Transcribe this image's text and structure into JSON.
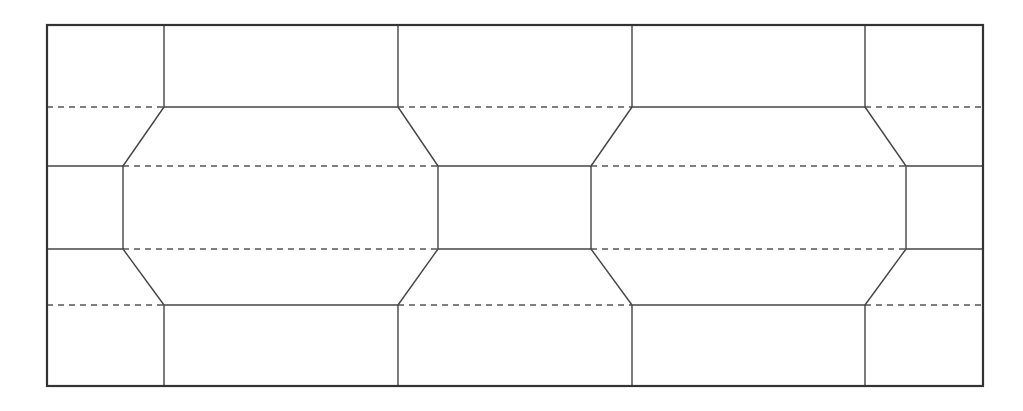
{
  "diagram": {
    "type": "tiling-octagon-grid",
    "width": 1023,
    "height": 411,
    "colors": {
      "background": "#ffffff",
      "line": "#444444",
      "dashed": "#555555",
      "border": "#333333"
    },
    "border": {
      "x1": 47,
      "y1": 25,
      "x2": 983,
      "y2": 386
    },
    "rows_y": [
      107,
      166,
      249,
      305
    ],
    "outer_verticals_x": [
      164,
      398,
      632,
      865
    ],
    "inner_verticals_x": [
      123,
      438,
      591,
      906
    ],
    "solid_segments": [
      [
        164,
        25,
        164,
        107
      ],
      [
        398,
        25,
        398,
        107
      ],
      [
        632,
        25,
        632,
        107
      ],
      [
        865,
        25,
        865,
        107
      ],
      [
        164,
        107,
        398,
        107
      ],
      [
        632,
        107,
        865,
        107
      ],
      [
        164,
        107,
        123,
        166
      ],
      [
        398,
        107,
        438,
        166
      ],
      [
        632,
        107,
        591,
        166
      ],
      [
        865,
        107,
        906,
        166
      ],
      [
        47,
        166,
        123,
        166
      ],
      [
        438,
        166,
        591,
        166
      ],
      [
        906,
        166,
        983,
        166
      ],
      [
        123,
        166,
        123,
        249
      ],
      [
        438,
        166,
        438,
        249
      ],
      [
        591,
        166,
        591,
        249
      ],
      [
        906,
        166,
        906,
        249
      ],
      [
        47,
        249,
        123,
        249
      ],
      [
        438,
        249,
        591,
        249
      ],
      [
        906,
        249,
        983,
        249
      ],
      [
        123,
        249,
        164,
        305
      ],
      [
        438,
        249,
        398,
        305
      ],
      [
        591,
        249,
        632,
        305
      ],
      [
        906,
        249,
        865,
        305
      ],
      [
        164,
        305,
        398,
        305
      ],
      [
        632,
        305,
        865,
        305
      ],
      [
        164,
        305,
        164,
        386
      ],
      [
        398,
        305,
        398,
        386
      ],
      [
        632,
        305,
        632,
        386
      ],
      [
        865,
        305,
        865,
        386
      ]
    ],
    "dashed_segments": [
      [
        47,
        107,
        164,
        107
      ],
      [
        398,
        107,
        632,
        107
      ],
      [
        865,
        107,
        983,
        107
      ],
      [
        123,
        166,
        438,
        166
      ],
      [
        591,
        166,
        906,
        166
      ],
      [
        123,
        249,
        438,
        249
      ],
      [
        591,
        249,
        906,
        249
      ],
      [
        47,
        305,
        164,
        305
      ],
      [
        398,
        305,
        632,
        305
      ],
      [
        865,
        305,
        983,
        305
      ]
    ]
  }
}
